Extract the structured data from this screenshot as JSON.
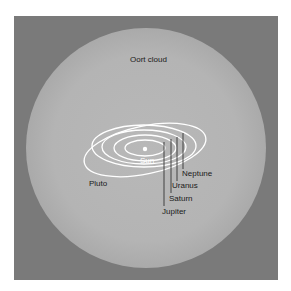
{
  "title": "Oort cloud",
  "labels": {
    "oort_cloud": "Oort cloud",
    "sun": "Sun",
    "pluto": "Pluto",
    "neptune": "Neptune",
    "uranus": "Uranus",
    "saturn": "Saturn",
    "jupiter": "Jupiter"
  },
  "colors": {
    "frame": "#7a7a7a",
    "cloud": "#b6b6b6",
    "orbits": "#ffffff",
    "leader_lines": "#333333",
    "text": "#1a1a1a"
  }
}
